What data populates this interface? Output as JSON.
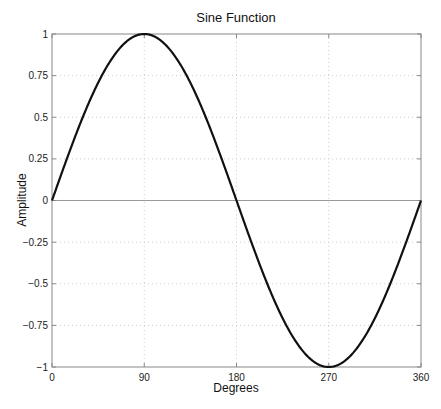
{
  "chart_data": {
    "type": "line",
    "title": "Sine Function",
    "xlabel": "Degrees",
    "ylabel": "Amplitude",
    "xlim": [
      0,
      360
    ],
    "ylim": [
      -1,
      1
    ],
    "xticks": [
      0,
      90,
      180,
      270,
      360
    ],
    "xtick_labels": [
      "0",
      "90",
      "180",
      "270",
      "360"
    ],
    "yticks": [
      1,
      0.75,
      0.5,
      0.25,
      0,
      -0.25,
      -0.5,
      -0.75,
      -1
    ],
    "ytick_labels": [
      "1",
      "0.75",
      "0.5",
      "0.25",
      "0",
      "−0.25",
      "−0.5",
      "−0.75",
      "−1"
    ],
    "grid": true,
    "legend": null,
    "zero_line": true,
    "series": [
      {
        "name": "sin(x)",
        "function": "sin(degrees)",
        "color": "#111111",
        "x": [
          0,
          30,
          60,
          90,
          120,
          150,
          180,
          210,
          240,
          270,
          300,
          330,
          360
        ],
        "values": [
          0,
          0.5,
          0.866,
          1,
          0.866,
          0.5,
          0,
          -0.5,
          -0.866,
          -1,
          -0.866,
          -0.5,
          0
        ]
      }
    ]
  },
  "colors": {
    "line": "#111111",
    "axes": "#888888",
    "grid": "#cccccc",
    "zero_line": "#999999"
  }
}
